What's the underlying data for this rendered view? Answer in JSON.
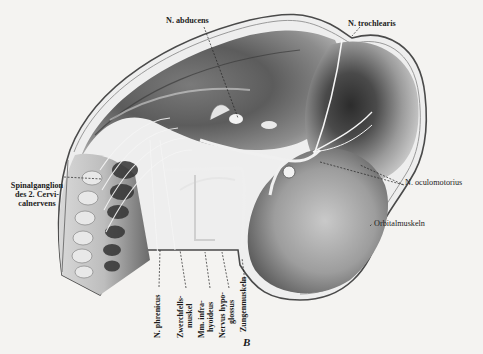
{
  "figure": {
    "panel_letter": "B",
    "labels": {
      "abducens": "N. abducens",
      "trochlearis": "N. trochlearis",
      "spinalganglion": [
        "Spinalganglion",
        "des 2. Cervi-",
        "calnervens"
      ],
      "oculomotorius": "N. oculomotorius",
      "orbitalmuskeln": "Orbitalmuskeln",
      "phrenicus": "N. phrenicus",
      "zwerchfellsmuskel": [
        "Zwerchfells-",
        "muskel"
      ],
      "infrahyoideus": [
        "Mm. infra-",
        "hyoideus"
      ],
      "hypoglossus": [
        "Nervus hypo-",
        "glossus"
      ],
      "zungenmuskeln": "Zungenmuskeln"
    }
  },
  "colors": {
    "paper": "#f4f3f1",
    "ink": "#1c1c1c",
    "tissue_dark": "#3a3a3a",
    "tissue_mid": "#8a8a8a",
    "tissue_light": "#d6d6d6"
  }
}
